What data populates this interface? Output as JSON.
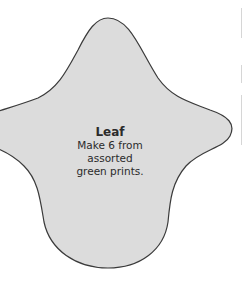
{
  "pattern_piece": {
    "name": "Leaf",
    "instruction_line1": "Make 6 from assorted",
    "instruction_line2": "green prints.",
    "fill_color": "#dcdcdc",
    "outline_color": "#3a3a3a"
  }
}
